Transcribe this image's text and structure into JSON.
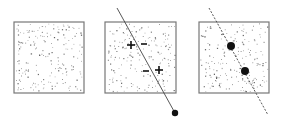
{
  "figure": {
    "panels": [
      {
        "id": "panel-1",
        "square": {
          "x": 14,
          "y": 22,
          "w": 70,
          "h": 71
        },
        "line": null,
        "markers": [],
        "dots": []
      },
      {
        "id": "panel-2",
        "square": {
          "x": 105,
          "y": 22,
          "w": 71,
          "h": 71
        },
        "line": {
          "x1": 117,
          "y1": 8,
          "x2": 175,
          "y2": 113,
          "style": "solid",
          "end_dot": true
        },
        "markers": [
          {
            "symbol": "+",
            "x": 131,
            "y": 45
          },
          {
            "symbol": "−",
            "x": 144,
            "y": 44
          },
          {
            "symbol": "−",
            "x": 146,
            "y": 71
          },
          {
            "symbol": "+",
            "x": 159,
            "y": 70
          }
        ],
        "dots": []
      },
      {
        "id": "panel-3",
        "square": {
          "x": 199,
          "y": 22,
          "w": 70,
          "h": 71
        },
        "line": {
          "x1": 209,
          "y1": 8,
          "x2": 268,
          "y2": 115,
          "style": "dashed",
          "end_dot": false
        },
        "markers": [],
        "dots": [
          {
            "x": 231,
            "y": 46,
            "r": 4
          },
          {
            "x": 245,
            "y": 71,
            "r": 4
          }
        ]
      }
    ],
    "colors": {
      "border": "#777777",
      "speckle": "#555555",
      "line": "#444444",
      "dot": "#111111"
    },
    "speckle_count": 190
  }
}
